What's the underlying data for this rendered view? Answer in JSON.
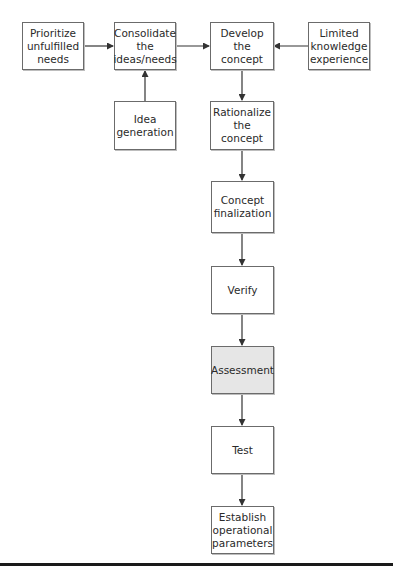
{
  "diagram": {
    "type": "flowchart",
    "nodes": [
      {
        "id": "prioritize",
        "label": "Prioritize\nunfulfilled\nneeds",
        "shaded": false
      },
      {
        "id": "consolidate",
        "label": "Consolidate\nthe\nideas/needs",
        "shaded": false
      },
      {
        "id": "develop",
        "label": "Develop\nthe\nconcept",
        "shaded": false
      },
      {
        "id": "limited",
        "label": "Limited\nknowledge\nexperience",
        "shaded": false
      },
      {
        "id": "idea",
        "label": "Idea\ngeneration",
        "shaded": false
      },
      {
        "id": "rationalize",
        "label": "Rationalize\nthe concept",
        "shaded": false
      },
      {
        "id": "finalization",
        "label": "Concept\nfinalization",
        "shaded": false
      },
      {
        "id": "verify",
        "label": "Verify",
        "shaded": false
      },
      {
        "id": "assessment",
        "label": "Assessment",
        "shaded": true
      },
      {
        "id": "test",
        "label": "Test",
        "shaded": false
      },
      {
        "id": "establish",
        "label": "Establish\noperational\nparameters",
        "shaded": false
      }
    ],
    "edges": [
      {
        "from": "prioritize",
        "to": "consolidate"
      },
      {
        "from": "idea",
        "to": "consolidate"
      },
      {
        "from": "consolidate",
        "to": "develop"
      },
      {
        "from": "limited",
        "to": "develop"
      },
      {
        "from": "develop",
        "to": "rationalize"
      },
      {
        "from": "rationalize",
        "to": "finalization"
      },
      {
        "from": "finalization",
        "to": "verify"
      },
      {
        "from": "verify",
        "to": "assessment"
      },
      {
        "from": "assessment",
        "to": "test"
      },
      {
        "from": "test",
        "to": "establish"
      }
    ],
    "colors": {
      "border": "#6b6b6b",
      "highlight_fill": "#e6e6e6",
      "line": "#333333"
    }
  }
}
